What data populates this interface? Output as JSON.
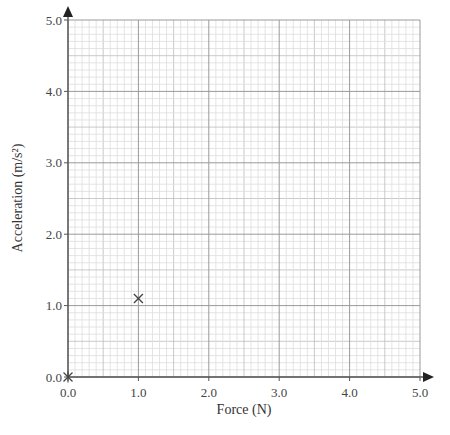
{
  "chart_data": {
    "type": "scatter",
    "title": "",
    "xlabel": "Force (N)",
    "ylabel": "Acceleration (m/s²)",
    "xlim": [
      0.0,
      5.0
    ],
    "ylim": [
      0.0,
      5.0
    ],
    "x_ticks": [
      "0.0",
      "1.0",
      "2.0",
      "3.0",
      "4.0",
      "5.0"
    ],
    "y_ticks": [
      "0.0",
      "1.0",
      "2.0",
      "3.0",
      "4.0",
      "5.0"
    ],
    "grid": true,
    "grid_minor_divisions": 10,
    "series": [
      {
        "name": "measurements",
        "marker": "x",
        "x": [
          0.0,
          1.0
        ],
        "y": [
          0.0,
          1.1
        ]
      }
    ]
  },
  "colors": {
    "major_grid": "#9a9a9a",
    "minor_grid": "#dddddd",
    "axis": "#555555",
    "marker": "#444444"
  }
}
